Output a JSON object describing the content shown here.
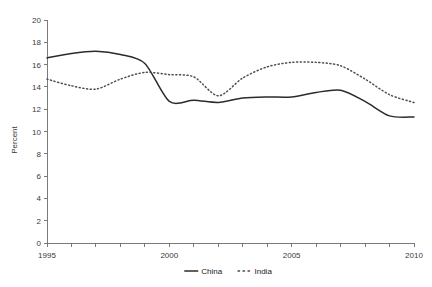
{
  "chart_data": {
    "type": "line",
    "title": "",
    "xlabel": "",
    "ylabel": "Percent",
    "xlim": [
      1995,
      2010
    ],
    "ylim": [
      0,
      20
    ],
    "grid": false,
    "legend_position": "bottom-center",
    "x": [
      1995,
      1996,
      1997,
      1998,
      1999,
      2000,
      2001,
      2002,
      2003,
      2004,
      2005,
      2006,
      2007,
      2008,
      2009,
      2010
    ],
    "xtick_values": [
      1995,
      1996,
      1997,
      1998,
      1999,
      2000,
      2001,
      2002,
      2003,
      2004,
      2005,
      2006,
      2007,
      2008,
      2009,
      2010
    ],
    "xtick_labels": [
      "1995",
      "",
      "",
      "",
      "",
      "2000",
      "",
      "",
      "",
      "",
      "2005",
      "",
      "",
      "",
      "",
      "2010"
    ],
    "ytick_values": [
      0,
      2,
      4,
      6,
      8,
      10,
      12,
      14,
      16,
      18,
      20
    ],
    "ytick_labels": [
      "0",
      "2",
      "4",
      "6",
      "8",
      "10",
      "12",
      "14",
      "16",
      "18",
      "20"
    ],
    "series": [
      {
        "name": "China",
        "style": "solid",
        "color": "#2b2b2b",
        "values": [
          16.6,
          17.0,
          17.2,
          16.9,
          16.1,
          12.7,
          12.8,
          12.6,
          13.0,
          13.1,
          13.1,
          13.5,
          13.7,
          12.7,
          11.4,
          11.3
        ]
      },
      {
        "name": "India",
        "style": "dotted",
        "color": "#4d4d4d",
        "values": [
          14.7,
          14.1,
          13.8,
          14.7,
          15.3,
          15.1,
          14.9,
          13.2,
          14.8,
          15.8,
          16.2,
          16.2,
          15.9,
          14.7,
          13.3,
          12.6
        ]
      }
    ]
  },
  "axes": {
    "y_axis_title": "Percent"
  },
  "legend": {
    "items": [
      {
        "label": "China",
        "style": "solid"
      },
      {
        "label": "India",
        "style": "dotted"
      }
    ]
  }
}
